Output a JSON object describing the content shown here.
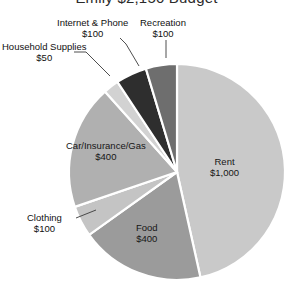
{
  "chart_data": {
    "type": "pie",
    "title": "Emily $2,150 Budget",
    "xlabel": "",
    "ylabel": "",
    "legend_position": "none",
    "grid": false,
    "total": 2150,
    "currency": "$",
    "start_angle_clock_position": 12,
    "direction": "clockwise",
    "categories": [
      "Rent",
      "Food",
      "Clothing",
      "Car/Insurance/Gas",
      "Household Supplies",
      "Internet & Phone",
      "Recreation"
    ],
    "values": [
      1000,
      400,
      100,
      400,
      50,
      100,
      100
    ],
    "slices": [
      {
        "name": "Rent",
        "label": "Rent",
        "amount_text": "$1,000",
        "value": 1000,
        "percent": 46.5,
        "color": "#c9c9c9",
        "label_placement": "inside"
      },
      {
        "name": "Food",
        "label": "Food",
        "amount_text": "$400",
        "value": 400,
        "percent": 18.6,
        "color": "#9b9b9b",
        "label_placement": "inside"
      },
      {
        "name": "Clothing",
        "label": "Clothing",
        "amount_text": "$100",
        "value": 100,
        "percent": 4.65,
        "color": "#c4c4c4",
        "label_placement": "outside"
      },
      {
        "name": "Car/Insurance/Gas",
        "label": "Car/Insurance/Gas",
        "amount_text": "$400",
        "value": 400,
        "percent": 18.6,
        "color": "#b0b0b0",
        "label_placement": "inside"
      },
      {
        "name": "Household Supplies",
        "label": "Household Supplies",
        "amount_text": "$50",
        "value": 50,
        "percent": 2.33,
        "color": "#d2d2d2",
        "label_placement": "outside"
      },
      {
        "name": "Internet & Phone",
        "label": "Internet & Phone",
        "amount_text": "$100",
        "value": 100,
        "percent": 4.65,
        "color": "#2e2e2e",
        "label_placement": "outside"
      },
      {
        "name": "Recreation",
        "label": "Recreation",
        "amount_text": "$100",
        "value": 100,
        "percent": 4.65,
        "color": "#6e6e6e",
        "label_placement": "outside"
      }
    ]
  }
}
